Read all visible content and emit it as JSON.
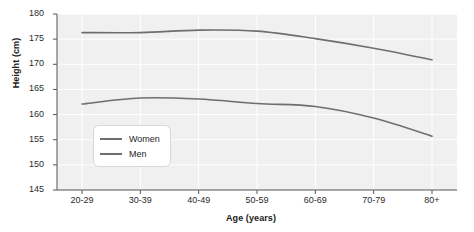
{
  "chart_data": {
    "type": "line",
    "title": "",
    "xlabel": "Age (years)",
    "ylabel": "Height (cm)",
    "categories": [
      "20-29",
      "30-39",
      "40-49",
      "50-59",
      "60-69",
      "70-79",
      "80+"
    ],
    "ylim": [
      145,
      180
    ],
    "yticks": [
      145,
      150,
      155,
      160,
      165,
      170,
      175,
      180
    ],
    "grid": true,
    "legend_position": "inside-left-lower",
    "series": [
      {
        "name": "Women",
        "color": "#6e6e6e",
        "values": [
          162.1,
          163.3,
          163.1,
          162.2,
          161.6,
          159.3,
          155.7
        ]
      },
      {
        "name": "Men",
        "color": "#6e6e6e",
        "values": [
          176.3,
          176.3,
          176.8,
          176.6,
          175.1,
          173.2,
          170.9
        ]
      }
    ]
  },
  "axes": {
    "y_tick_labels": [
      "180",
      "175",
      "170",
      "165",
      "160",
      "155",
      "150",
      "145"
    ],
    "x_tick_labels": [
      "20-29",
      "30-39",
      "40-49",
      "50-59",
      "60-69",
      "70-79",
      "80+"
    ],
    "y_title": "Height (cm)",
    "x_title": "Age (years)"
  },
  "legend": {
    "items": [
      {
        "label": "Women"
      },
      {
        "label": "Men"
      }
    ]
  },
  "colors": {
    "line": "#6e6e6e",
    "plot_background": "#f0f0f0",
    "grid": "#ffffff",
    "axis": "#4d4d4d",
    "text": "#2b2b2b"
  }
}
